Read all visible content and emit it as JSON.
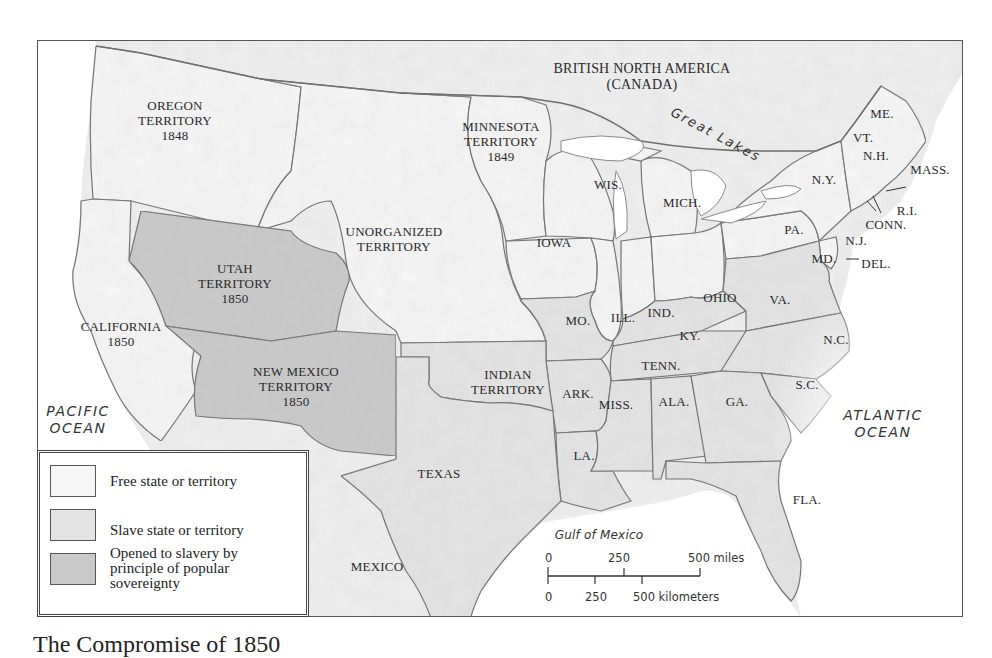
{
  "map": {
    "caption": "The Compromise of 1850",
    "colors": {
      "free": "#f6f6f6",
      "slave": "#e4e4e4",
      "popular_sovereignty": "#c9c9c9",
      "water": "#ffffff",
      "border": "#6e6e6e",
      "foreign": "#efefef"
    },
    "regions": {
      "canada": [
        "BRITISH NORTH AMERICA",
        "(CANADA)"
      ],
      "great_lakes": "Great Lakes",
      "oregon": [
        "OREGON",
        "TERRITORY",
        "1848"
      ],
      "minnesota": [
        "MINNESOTA",
        "TERRITORY",
        "1849"
      ],
      "unorganized": [
        "UNORGANIZED",
        "TERRITORY"
      ],
      "utah": [
        "UTAH",
        "TERRITORY",
        "1850"
      ],
      "california": [
        "CALIFORNIA",
        "1850"
      ],
      "new_mexico": [
        "NEW MEXICO",
        "TERRITORY",
        "1850"
      ],
      "indian": [
        "INDIAN",
        "TERRITORY"
      ],
      "texas": "TEXAS",
      "mexico": "MEXICO",
      "pacific": [
        "PACIFIC",
        "OCEAN"
      ],
      "atlantic": [
        "ATLANTIC",
        "OCEAN"
      ],
      "gulf": "Gulf of Mexico"
    },
    "states": {
      "me": "ME.",
      "vt": "VT.",
      "nh": "N.H.",
      "mass": "MASS.",
      "ri": "R.I.",
      "conn": "CONN.",
      "ny": "N.Y.",
      "nj": "N.J.",
      "pa": "PA.",
      "del": "DEL.",
      "md": "MD.",
      "va": "VA.",
      "nc": "N.C.",
      "sc": "S.C.",
      "ga": "GA.",
      "fla": "FLA.",
      "ala": "ALA.",
      "miss": "MISS.",
      "la": "LA.",
      "ark": "ARK.",
      "tenn": "TENN.",
      "ky": "KY.",
      "ohio": "OHIO",
      "ind": "IND.",
      "ill": "ILL.",
      "mich": "MICH.",
      "wis": "WIS.",
      "iowa": "IOWA",
      "mo": "MO."
    },
    "legend": [
      {
        "label": "Free state or territory",
        "color": "#f6f6f6"
      },
      {
        "label": "Slave state or territory",
        "color": "#e4e4e4"
      },
      {
        "label": "Opened to slavery by principle of popular sovereignty",
        "color": "#c9c9c9"
      }
    ],
    "scale": {
      "miles_ticks": [
        "0",
        "250",
        "500 miles"
      ],
      "km_ticks": [
        "0",
        "250",
        "500 kilometers"
      ]
    }
  }
}
